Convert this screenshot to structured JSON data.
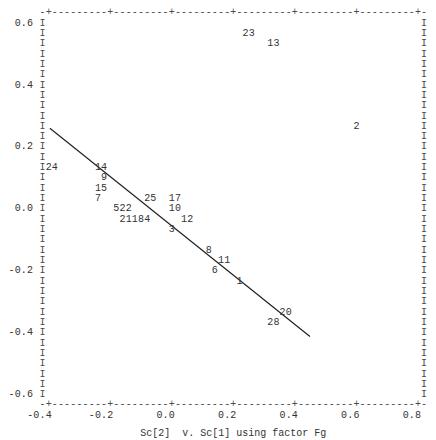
{
  "chart_data": {
    "type": "scatter",
    "title": "",
    "caption": "Sc[2]  v. Sc[1] using factor Fg",
    "xlabel": "Sc[1]",
    "ylabel": "Sc[2]",
    "factor": "Fg",
    "xlim": [
      -0.4,
      0.8
    ],
    "ylim": [
      -0.6,
      0.6
    ],
    "x_ticks": [
      -0.4,
      -0.2,
      0.0,
      0.2,
      0.4,
      0.6,
      0.8
    ],
    "x_tick_labels": [
      "-0.4",
      "-0.2",
      "0.0",
      "0.2",
      "0.4",
      "0.6",
      "0.8"
    ],
    "y_ticks": [
      0.6,
      0.4,
      0.2,
      0.0,
      -0.2,
      -0.4,
      -0.6
    ],
    "y_tick_labels": [
      "0.6",
      "0.4",
      "0.2",
      "0.0",
      "-0.2",
      "-0.4",
      "-0.6"
    ],
    "grid": false,
    "legend": null,
    "marker_style": "point-number labels (character plot)",
    "points": [
      {
        "label": "23",
        "x": 0.24,
        "y": 0.567
      },
      {
        "label": "13",
        "x": 0.32,
        "y": 0.533
      },
      {
        "label": "2",
        "x": 0.6,
        "y": 0.267
      },
      {
        "label": "24",
        "x": -0.4,
        "y": 0.133
      },
      {
        "label": "14",
        "x": -0.24,
        "y": 0.133
      },
      {
        "label": "9",
        "x": -0.22,
        "y": 0.1
      },
      {
        "label": "15",
        "x": -0.24,
        "y": 0.067
      },
      {
        "label": "7",
        "x": -0.24,
        "y": 0.033
      },
      {
        "label": "25",
        "x": -0.08,
        "y": 0.033
      },
      {
        "label": "17",
        "x": 0.0,
        "y": 0.033
      },
      {
        "label": "5",
        "x": -0.18,
        "y": 0.0
      },
      {
        "label": "22",
        "x": -0.16,
        "y": 0.0
      },
      {
        "label": "10",
        "x": 0.0,
        "y": 0.0
      },
      {
        "label": "21",
        "x": -0.16,
        "y": -0.033
      },
      {
        "label": "18",
        "x": -0.12,
        "y": -0.033
      },
      {
        "label": "4",
        "x": -0.08,
        "y": -0.033
      },
      {
        "label": "12",
        "x": 0.04,
        "y": -0.033
      },
      {
        "label": "3",
        "x": 0.0,
        "y": -0.067
      },
      {
        "label": "8",
        "x": 0.12,
        "y": -0.133
      },
      {
        "label": "11",
        "x": 0.16,
        "y": -0.167
      },
      {
        "label": "6",
        "x": 0.14,
        "y": -0.2
      },
      {
        "label": "1",
        "x": 0.22,
        "y": -0.233
      },
      {
        "label": "20",
        "x": 0.36,
        "y": -0.333
      },
      {
        "label": "28",
        "x": 0.32,
        "y": -0.367
      }
    ],
    "fit_line": {
      "x1": -0.396,
      "y1": 0.257,
      "x2": 0.449,
      "y2": -0.416
    },
    "border_chars": {
      "horizontal": "-",
      "tick": "+",
      "vertical": "I"
    }
  },
  "colors": {
    "background": "#ffffff",
    "text": "#333333",
    "border": "#4a4a4a",
    "line": "#222222"
  }
}
